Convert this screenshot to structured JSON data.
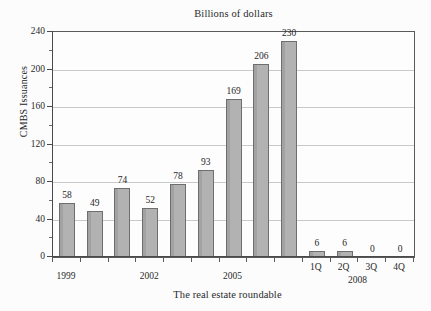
{
  "chart_data": {
    "type": "bar",
    "title": "Billions of dollars",
    "xlabel": "The real estate roundable",
    "ylabel": "CMBS Issuances",
    "categories": [
      "1999",
      "2000",
      "2001",
      "2002",
      "2003",
      "2004",
      "2005",
      "2006",
      "2007",
      "1Q",
      "2Q",
      "3Q",
      "4Q"
    ],
    "values": [
      58,
      49,
      74,
      52,
      78,
      93,
      169,
      206,
      230,
      6,
      6,
      0,
      0
    ],
    "data_labels": [
      "58",
      "49",
      "74",
      "52",
      "78",
      "93",
      "169",
      "206",
      "230",
      "6",
      "6",
      "0",
      "0"
    ],
    "x_tick_labels_shown": [
      "1999",
      "2002",
      "2005"
    ],
    "quarter_tick_labels": [
      "1Q",
      "2Q",
      "3Q",
      "4Q"
    ],
    "quarter_group_label": "2008",
    "ylim": [
      0,
      240
    ],
    "y_ticks": [
      0,
      40,
      80,
      120,
      160,
      200,
      240
    ],
    "y_tick_labels": [
      "0",
      "40",
      "80",
      "120",
      "160",
      "200",
      "240"
    ],
    "y_minor_ticks": [
      20,
      60,
      100,
      140,
      180,
      220
    ],
    "grid": true,
    "grid_axis": "y",
    "legend": "none",
    "bar_color": "#b2b2b2",
    "bar_border_color": "#6e6e6e",
    "gridline_color": "#c9c9c9",
    "axis_color": "#4a4a4a",
    "background_color": "#fcfcfc",
    "text_color": "#1c1c1c"
  }
}
